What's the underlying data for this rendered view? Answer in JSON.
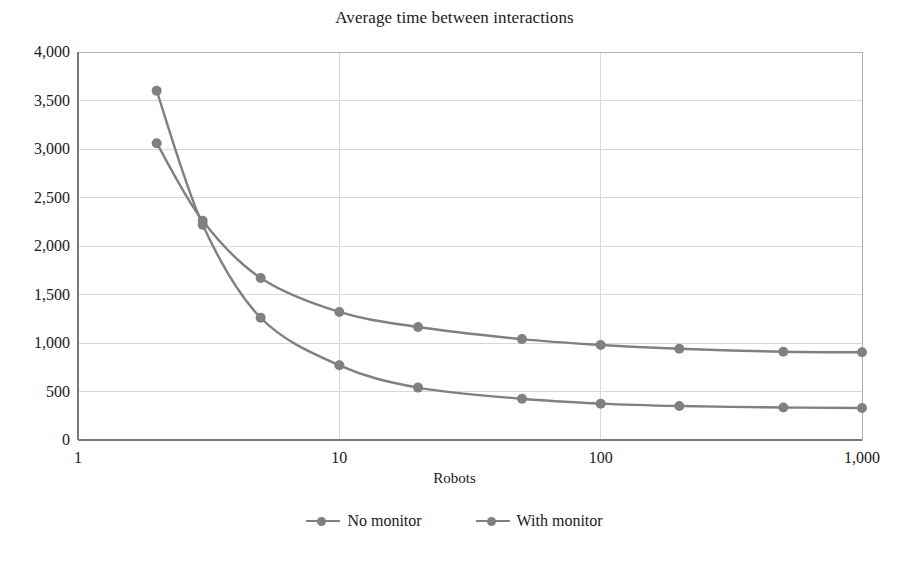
{
  "chart_data": {
    "type": "line",
    "title": "Average time between interactions",
    "xlabel": "Robots",
    "ylabel": "",
    "xscale": "log",
    "xlim": [
      1,
      1000
    ],
    "ylim": [
      0,
      4000
    ],
    "grid": true,
    "legend_position": "bottom",
    "x": [
      2,
      3,
      5,
      10,
      20,
      50,
      100,
      200,
      500,
      1000
    ],
    "xticks": [
      1,
      10,
      100,
      1000
    ],
    "xtick_labels": [
      "1",
      "10",
      "100",
      "1,000"
    ],
    "yticks": [
      0,
      500,
      1000,
      1500,
      2000,
      2500,
      3000,
      3500,
      4000
    ],
    "ytick_labels": [
      "0",
      "500",
      "1,000",
      "1,500",
      "2,000",
      "2,500",
      "3,000",
      "3,500",
      "4,000"
    ],
    "series": [
      {
        "name": "No monitor",
        "color": "#808080",
        "values": [
          3600,
          2220,
          1260,
          770,
          540,
          425,
          375,
          350,
          335,
          330
        ]
      },
      {
        "name": "With monitor",
        "color": "#808080",
        "values": [
          3060,
          2260,
          1670,
          1320,
          1165,
          1040,
          980,
          940,
          910,
          905
        ]
      }
    ]
  },
  "legend": {
    "items": [
      {
        "label": "No monitor"
      },
      {
        "label": "With monitor"
      }
    ]
  },
  "axes": {
    "plot_left": 78,
    "plot_right": 862,
    "plot_top": 52,
    "plot_bottom": 440
  }
}
